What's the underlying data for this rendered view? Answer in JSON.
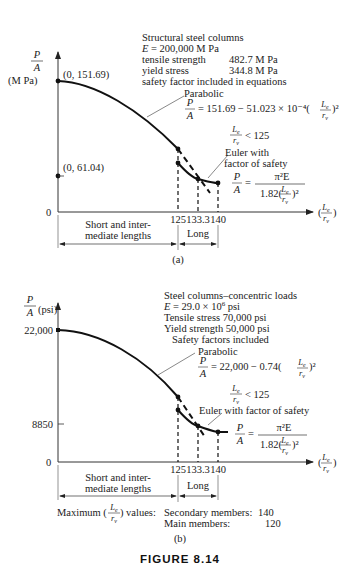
{
  "figure_caption": "FIGURE 8.14",
  "panel_a": {
    "label": "(a)",
    "y_axis_label_num": "P",
    "y_axis_label_den": "A",
    "y_axis_unit": "(M Pa)",
    "point_top": "(0, 151.69)",
    "point_mid": "(0, 61.04)",
    "origin": "0",
    "info_lines": [
      "Structural steel columns",
      "E = 200,000 M Pa",
      "tensile strength   482.7 M Pa",
      "yield stress          344.8 M Pa",
      "safety factor included in equations"
    ],
    "parabolic_label": "Parabolic",
    "parabolic_eq": "= 151.69 − 51.023 × 10⁻⁴(",
    "condition": "< 125",
    "euler_label_1": "Euler with",
    "euler_label_2": "factor of safety",
    "euler_eq_num": "π²E",
    "euler_eq_den": "1.82(",
    "x_ticks": [
      "125",
      "133.3",
      "140"
    ],
    "region_short_1": "Short and inter-",
    "region_short_2": "mediate lengths",
    "region_long": "Long"
  },
  "panel_b": {
    "label": "(b)",
    "y_axis_unit": "(psi)",
    "y_tick_top": "22,000",
    "y_tick_mid": "8850",
    "origin": "0",
    "info_lines": [
      "Steel columns–concentric loads",
      "E = 29.0 × 10⁶ psi",
      "Tensile stress 70,000 psi",
      "Yield strength 50,000 psi",
      "Safety factors included"
    ],
    "parabolic_label": "Parabolic",
    "parabolic_eq": "= 22,000 − 0.74(",
    "condition": "< 125",
    "euler_label": "Euler with factor of safety",
    "euler_eq_num": "π²E",
    "euler_eq_den": "1.82(",
    "x_ticks": [
      "125",
      "133.3",
      "140"
    ],
    "region_short_1": "Short and inter-",
    "region_short_2": "mediate lengths",
    "region_long": "Long",
    "max_values_label": "Maximum (",
    "max_values_suffix": ") values:",
    "secondary_label": "Secondary members:",
    "secondary_value": "140",
    "main_label": "Main members:",
    "main_value": "120"
  },
  "symbols": {
    "Le": "L",
    "Le_sub": "e",
    "rv": "r",
    "rv_sub": "v",
    "P": "P",
    "A": "A",
    "eq": "=",
    "sq": ")²"
  }
}
